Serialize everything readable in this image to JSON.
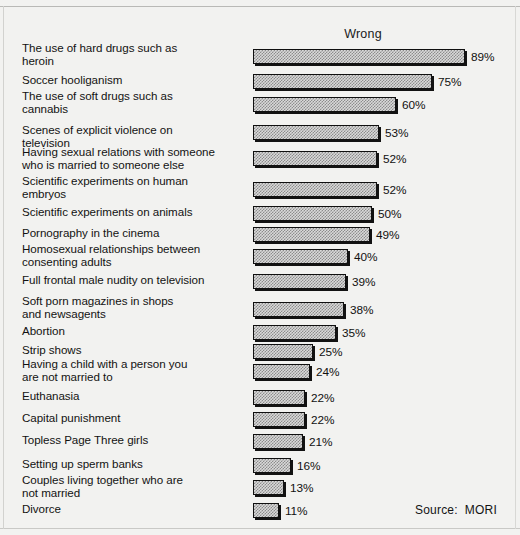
{
  "chart_data": {
    "type": "bar",
    "title": "Wrong",
    "orientation": "horizontal",
    "xlabel": "",
    "ylabel": "",
    "value_suffix": "%",
    "xlim": [
      0,
      100
    ],
    "grid": false,
    "legend": false,
    "source": "Source:  MORI",
    "categories": [
      "The use of hard drugs such as\nheroin",
      "Soccer hooliganism",
      "The use of soft drugs such as\ncannabis",
      "Scenes of explicit violence on\ntelevision",
      "Having sexual relations with someone\nwho is married to someone else",
      "Scientific experiments on human\nembryos",
      "Scientific experiments on animals",
      "Pornography in the cinema",
      "Homosexual relationships between\nconsenting adults",
      "Full frontal male nudity on television",
      "Soft porn magazines in shops\nand newsagents",
      "Abortion",
      "Strip shows",
      "Having a child with a person you\nare not married to",
      "Euthanasia",
      "Capital punishment",
      "Topless Page Three girls",
      "Setting up sperm banks",
      "Couples living together who are\nnot married",
      "Divorce"
    ],
    "values": [
      89,
      75,
      60,
      53,
      52,
      52,
      50,
      49,
      40,
      39,
      38,
      35,
      25,
      24,
      22,
      22,
      21,
      16,
      13,
      11
    ],
    "value_labels": [
      "89%",
      "75%",
      "60%",
      "53%",
      "52%",
      "52%",
      "50%",
      "49%",
      "40%",
      "39%",
      "38%",
      "35%",
      "25%",
      "24%",
      "22%",
      "22%",
      "21%",
      "16%",
      "13%",
      "11%"
    ]
  },
  "layout": {
    "bar_origin_x": 253,
    "px_per_percent": 2.382,
    "bar_height": 15,
    "row_tops": [
      49,
      74,
      97,
      125,
      151,
      182,
      206,
      227,
      249,
      274,
      302,
      325,
      344,
      364,
      390,
      412,
      434,
      458,
      480,
      503
    ],
    "label_tops": [
      42,
      74,
      90,
      124,
      146,
      175,
      206,
      227,
      243,
      274,
      295,
      325,
      344,
      358,
      390,
      412,
      434,
      458,
      474,
      503
    ]
  },
  "colors": {
    "background": "#f2f2f0",
    "bar_outline": "#101010",
    "bar_fill_light": "#d9d9d9",
    "bar_fill_dark": "#8c8c8c",
    "text": "#121212"
  }
}
